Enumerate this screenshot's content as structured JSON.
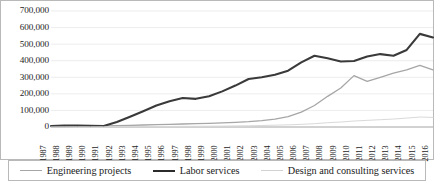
{
  "chart_data": {
    "type": "line",
    "title": "",
    "xlabel": "",
    "ylabel": "",
    "ylim": [
      0,
      700000
    ],
    "ytick_step": 100000,
    "grid": true,
    "legend_position": "bottom",
    "ytick_labels": [
      "700,000",
      "600,000",
      "500,000",
      "400,000",
      "300,000",
      "200,000",
      "100,000",
      "0"
    ],
    "ytick_values": [
      700000,
      600000,
      500000,
      400000,
      300000,
      200000,
      100000,
      0
    ],
    "categories": [
      "1987",
      "1988",
      "1989",
      "1990",
      "1991",
      "1992",
      "1993",
      "1994",
      "1995",
      "1996",
      "1997",
      "1998",
      "1999",
      "2000",
      "2001",
      "2002",
      "2003",
      "2004",
      "2005",
      "2006",
      "2007",
      "2008",
      "2009",
      "2010",
      "2011",
      "2012",
      "2013",
      "2014",
      "2015",
      "2016"
    ],
    "series": [
      {
        "name": "Engineering projects",
        "color": "#a6a6a6",
        "width": 1.3,
        "values": [
          2000,
          3000,
          4000,
          5000,
          6000,
          8000,
          10000,
          12000,
          14000,
          16000,
          18000,
          20000,
          22000,
          25000,
          28000,
          32000,
          38000,
          48000,
          62000,
          90000,
          130000,
          185000,
          235000,
          310000,
          275000,
          300000,
          325000,
          345000,
          372000,
          345000
        ]
      },
      {
        "name": "Labor services",
        "color": "#3a3a3a",
        "width": 2.1,
        "values": [
          6000,
          8000,
          9000,
          7000,
          6000,
          30000,
          62000,
          95000,
          130000,
          155000,
          175000,
          170000,
          185000,
          215000,
          250000,
          290000,
          300000,
          315000,
          340000,
          390000,
          430000,
          415000,
          395000,
          398000,
          425000,
          440000,
          430000,
          465000,
          562000,
          540000
        ]
      },
      {
        "name": "Design and consulting services",
        "color": "#d9d9d9",
        "width": 1.0,
        "values": [
          500,
          800,
          1000,
          1200,
          1400,
          1800,
          2200,
          2600,
          3000,
          3400,
          3800,
          4200,
          4800,
          5500,
          6500,
          7500,
          9000,
          11000,
          13000,
          16000,
          20000,
          26000,
          30000,
          36000,
          40000,
          44000,
          48000,
          54000,
          60000,
          58000
        ]
      }
    ]
  },
  "legend": {
    "items": [
      {
        "label": "Engineering projects"
      },
      {
        "label": "Labor services"
      },
      {
        "label": "Design and consulting services"
      }
    ]
  },
  "caption": {
    "text": ""
  }
}
